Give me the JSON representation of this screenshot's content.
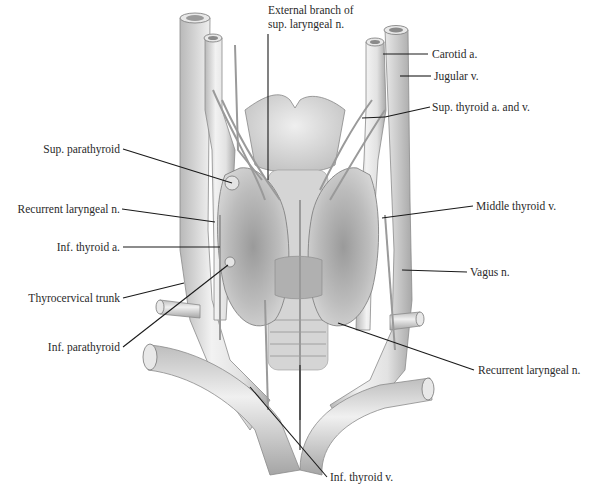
{
  "figure": {
    "labels": {
      "ext_branch_line1": "External branch of",
      "ext_branch_line2": "sup. laryngeal n.",
      "carotid": "Carotid a.",
      "jugular": "Jugular v.",
      "sup_thyroid_av": "Sup. thyroid a. and v.",
      "sup_parathyroid": "Sup. parathyroid",
      "recurrent_left": "Recurrent laryngeal n.",
      "inf_thyroid_a": "Inf. thyroid a.",
      "middle_thyroid_v": "Middle thyroid v.",
      "vagus": "Vagus n.",
      "thyrocervical": "Thyrocervical trunk",
      "inf_parathyroid": "Inf. parathyroid",
      "recurrent_right": "Recurrent laryngeal n.",
      "inf_thyroid_v": "Inf. thyroid v."
    }
  }
}
